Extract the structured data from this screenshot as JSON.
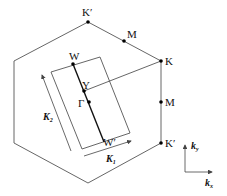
{
  "diagram": {
    "type": "brillouin-zone",
    "hexagon_points": {
      "K_prime_top": "K′",
      "M_upper": "M",
      "K": "K",
      "M_right": "M",
      "K_prime_lower": "K′"
    },
    "inner_points": {
      "W": "W",
      "Y": "Y",
      "Gamma": "Γ",
      "W_prime": "W′"
    },
    "vectors": {
      "K1": {
        "base": "K",
        "sub": "1"
      },
      "K2": {
        "base": "K",
        "sub": "2"
      }
    },
    "axes": {
      "ky": {
        "base": "k",
        "sub": "y"
      },
      "kx": {
        "base": "k",
        "sub": "x"
      }
    },
    "colors": {
      "line": "#555555",
      "path": "#111111",
      "point": "#000000"
    }
  }
}
